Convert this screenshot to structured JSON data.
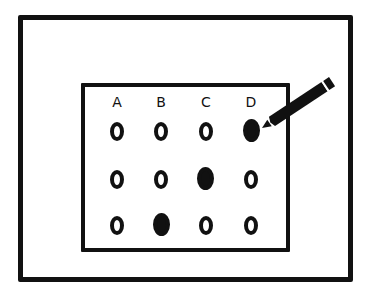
{
  "figure": {
    "colors": {
      "ink": "#111111",
      "paper": "#ffffff"
    },
    "columns": [
      "A",
      "B",
      "C",
      "D"
    ],
    "rows": [
      {
        "index": 1,
        "filled": "D"
      },
      {
        "index": 2,
        "filled": "C"
      },
      {
        "index": 3,
        "filled": "B"
      }
    ],
    "icon": "pencil-icon"
  }
}
